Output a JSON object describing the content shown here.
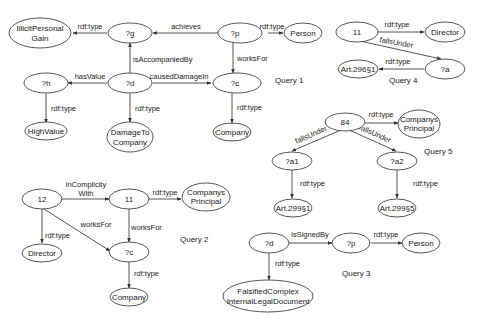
{
  "diagram": {
    "type": "rdf-query-graphs",
    "queries": [
      {
        "id": "q1",
        "label": "Query 1",
        "nodes": [
          {
            "id": "q1_illicit",
            "lines": [
              "IllicitPersonal",
              "Gain"
            ]
          },
          {
            "id": "q1_g",
            "lines": [
              "?g"
            ]
          },
          {
            "id": "q1_p",
            "lines": [
              "?p"
            ]
          },
          {
            "id": "q1_person",
            "lines": [
              "Person"
            ]
          },
          {
            "id": "q1_h",
            "lines": [
              "?h"
            ]
          },
          {
            "id": "q1_d",
            "lines": [
              "?d"
            ]
          },
          {
            "id": "q1_c",
            "lines": [
              "?c"
            ]
          },
          {
            "id": "q1_highvalue",
            "lines": [
              "HighValue"
            ]
          },
          {
            "id": "q1_damage",
            "lines": [
              "DamageTo",
              "Company"
            ]
          },
          {
            "id": "q1_company",
            "lines": [
              "Company"
            ]
          }
        ],
        "edges": [
          {
            "from": "q1_g",
            "to": "q1_illicit",
            "label": "rdf:type"
          },
          {
            "from": "q1_p",
            "to": "q1_g",
            "label": "achieves"
          },
          {
            "from": "q1_p",
            "to": "q1_person",
            "label": "rdf:type"
          },
          {
            "from": "q1_d",
            "to": "q1_g",
            "label": "isAccompaniedBy"
          },
          {
            "from": "q1_p",
            "to": "q1_c",
            "label": "worksFor"
          },
          {
            "from": "q1_d",
            "to": "q1_h",
            "label": "hasValue"
          },
          {
            "from": "q1_d",
            "to": "q1_c",
            "label": "causedDamageIn"
          },
          {
            "from": "q1_h",
            "to": "q1_highvalue",
            "label": "rdf:type"
          },
          {
            "from": "q1_d",
            "to": "q1_damage",
            "label": "rdf:type"
          },
          {
            "from": "q1_c",
            "to": "q1_company",
            "label": "rdf:type"
          }
        ]
      },
      {
        "id": "q2",
        "label": "Query 2",
        "nodes": [
          {
            "id": "q2_12",
            "lines": [
              "12"
            ]
          },
          {
            "id": "q2_11",
            "lines": [
              "11"
            ]
          },
          {
            "id": "q2_principal",
            "lines": [
              "Companys",
              "Principal"
            ]
          },
          {
            "id": "q2_director",
            "lines": [
              "Director"
            ]
          },
          {
            "id": "q2_c",
            "lines": [
              "?c"
            ]
          },
          {
            "id": "q2_company",
            "lines": [
              "Company"
            ]
          }
        ],
        "edges": [
          {
            "from": "q2_12",
            "to": "q2_11",
            "label": "inComplicity With",
            "label_lines": [
              "inComplicity",
              "With"
            ]
          },
          {
            "from": "q2_11",
            "to": "q2_principal",
            "label": "rdf:type"
          },
          {
            "from": "q2_12",
            "to": "q2_director",
            "label": "rdf:type"
          },
          {
            "from": "q2_12",
            "to": "q2_c",
            "label": "worksFor"
          },
          {
            "from": "q2_11",
            "to": "q2_c",
            "label": "worksFor"
          },
          {
            "from": "q2_c",
            "to": "q2_company",
            "label": "rdf:type"
          }
        ]
      },
      {
        "id": "q3",
        "label": "Query 3",
        "nodes": [
          {
            "id": "q3_d",
            "lines": [
              "?d"
            ]
          },
          {
            "id": "q3_p",
            "lines": [
              "?p"
            ]
          },
          {
            "id": "q3_person",
            "lines": [
              "Person"
            ]
          },
          {
            "id": "q3_doc",
            "lines": [
              "FalsifiedComplex",
              "InternalLegalDocument"
            ]
          }
        ],
        "edges": [
          {
            "from": "q3_d",
            "to": "q3_p",
            "label": "isSignedBy"
          },
          {
            "from": "q3_p",
            "to": "q3_person",
            "label": "rdf:type"
          },
          {
            "from": "q3_d",
            "to": "q3_doc",
            "label": "rdf:type"
          }
        ]
      },
      {
        "id": "q4",
        "label": "Query 4",
        "nodes": [
          {
            "id": "q4_11",
            "lines": [
              "11"
            ]
          },
          {
            "id": "q4_director",
            "lines": [
              "Director"
            ]
          },
          {
            "id": "q4_a",
            "lines": [
              "?a"
            ]
          },
          {
            "id": "q4_art",
            "lines": [
              "Art.296§1"
            ]
          }
        ],
        "edges": [
          {
            "from": "q4_11",
            "to": "q4_director",
            "label": "rdf:type"
          },
          {
            "from": "q4_11",
            "to": "q4_a",
            "label": "fallsUnder"
          },
          {
            "from": "q4_a",
            "to": "q4_art",
            "label": "rdf:type"
          }
        ]
      },
      {
        "id": "q5",
        "label": "Query 5",
        "nodes": [
          {
            "id": "q5_84",
            "lines": [
              "84"
            ]
          },
          {
            "id": "q5_principal",
            "lines": [
              "Companys",
              "Principal"
            ]
          },
          {
            "id": "q5_a1",
            "lines": [
              "?a1"
            ]
          },
          {
            "id": "q5_a2",
            "lines": [
              "?a2"
            ]
          },
          {
            "id": "q5_art1",
            "lines": [
              "Art.299§1"
            ]
          },
          {
            "id": "q5_art5",
            "lines": [
              "Art.299§5"
            ]
          }
        ],
        "edges": [
          {
            "from": "q5_84",
            "to": "q5_principal",
            "label": "rdf:type"
          },
          {
            "from": "q5_84",
            "to": "q5_a1",
            "label": "fallsUnder"
          },
          {
            "from": "q5_84",
            "to": "q5_a2",
            "label": "fallsUnder"
          },
          {
            "from": "q5_a1",
            "to": "q5_art1",
            "label": "rdf:type"
          },
          {
            "from": "q5_a2",
            "to": "q5_art5",
            "label": "rdf:type"
          }
        ]
      }
    ]
  },
  "labels": {
    "q1": {
      "title": "Query 1",
      "illicit_1": "IllicitPersonal",
      "illicit_2": "Gain",
      "g": "?g",
      "p": "?p",
      "person": "Person",
      "h": "?h",
      "d": "?d",
      "c": "?c",
      "highvalue": "HighValue",
      "damage_1": "DamageTo",
      "damage_2": "Company",
      "company": "Company",
      "e_g_type": "rdf:type",
      "e_achieves": "achieves",
      "e_p_type": "rdf:type",
      "e_accompanied": "isAccompaniedBy",
      "e_worksfor": "worksFor",
      "e_hasvalue": "hasValue",
      "e_caused": "causedDamageIn",
      "e_h_type": "rdf:type",
      "e_d_type": "rdf:type",
      "e_c_type": "rdf:type"
    },
    "q2": {
      "title": "Query 2",
      "n12": "12",
      "n11": "11",
      "principal_1": "Companys",
      "principal_2": "Principal",
      "director": "Director",
      "c": "?c",
      "company": "Company",
      "e_complicity_1": "inComplicity",
      "e_complicity_2": "With",
      "e_11_type": "rdf:type",
      "e_12_type": "rdf:type",
      "e_12_worksfor": "worksFor",
      "e_11_worksfor": "worksFor",
      "e_c_type": "rdf:type"
    },
    "q3": {
      "title": "Query 3",
      "d": "?d",
      "p": "?p",
      "person": "Person",
      "doc_1": "FalsifiedComplex",
      "doc_2": "InternalLegalDocument",
      "e_signed": "isSignedBy",
      "e_p_type": "rdf:type",
      "e_d_type": "rdf:type"
    },
    "q4": {
      "title": "Query 4",
      "n11": "11",
      "director": "Director",
      "a": "?a",
      "art": "Art.296§1",
      "e_11_type": "rdf:type",
      "e_falls": "fallsUnder",
      "e_a_type": "rdf:type"
    },
    "q5": {
      "title": "Query 5",
      "n84": "84",
      "principal_1": "Companys",
      "principal_2": "Principal",
      "a1": "?a1",
      "a2": "?a2",
      "art1": "Art.299§1",
      "art5": "Art.299§5",
      "e_84_type": "rdf:type",
      "e_falls1": "fallsUnder",
      "e_falls2": "fallsUnder",
      "e_a1_type": "rdf:type",
      "e_a2_type": "rdf:type"
    }
  },
  "colors": {
    "background": "#ffffff",
    "stroke": "#444444",
    "text": "#222222"
  }
}
